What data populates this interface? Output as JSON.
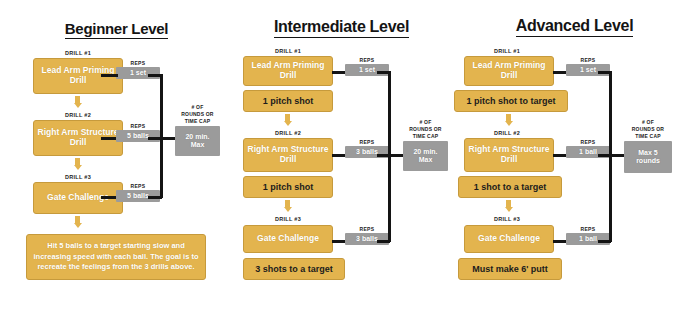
{
  "palette": {
    "gold": "#E3B44E",
    "gold_border": "#C69A3C",
    "gray": "#9B9B9B",
    "line": "#141414",
    "background": "#FFFFFF"
  },
  "columns": [
    {
      "id": "beginner",
      "title": "Beginner Level",
      "cap": {
        "label": "# OF\nROUNDS OR\nTIME CAP",
        "value": "20 min.\nMax"
      },
      "steps": [
        {
          "drill_caption": "DRILL #1",
          "box": "Lead Arm\nPriming Drill",
          "reps_label": "REPS",
          "reps_value": "1 set"
        },
        {
          "drill_caption": "DRILL #2",
          "box": "Right Arm\nStructure Drill",
          "reps_label": "REPS",
          "reps_value": "5 balls"
        },
        {
          "drill_caption": "DRILL #3",
          "box": "Gate Challenge",
          "reps_label": "REPS",
          "reps_value": "5 balls"
        }
      ],
      "summary": "Hit 5 balls to a target starting slow and increasing speed with each ball. The goal is to recreate the feelings from the 3 drills above."
    },
    {
      "id": "intermediate",
      "title": "Intermediate Level",
      "cap": {
        "label": "# OF\nROUNDS OR\nTIME CAP",
        "value": "20 min.\nMax"
      },
      "steps": [
        {
          "drill_caption": "DRILL #1",
          "box": "Lead Arm\nPriming Drill",
          "reps_label": "REPS",
          "reps_value": "1 set",
          "followup": "1 pitch shot"
        },
        {
          "drill_caption": "DRILL #2",
          "box": "Right Arm\nStructure Drill",
          "reps_label": "REPS",
          "reps_value": "3 balls",
          "followup": "1 pitch shot"
        },
        {
          "drill_caption": "DRILL #3",
          "box": "Gate Challenge",
          "reps_label": "REPS",
          "reps_value": "3 balls",
          "followup": "3 shots to a target"
        }
      ]
    },
    {
      "id": "advanced",
      "title": "Advanced Level",
      "cap": {
        "label": "# OF\nROUNDS OR\nTIME CAP",
        "value": "Max 5\nrounds"
      },
      "steps": [
        {
          "drill_caption": "DRILL #1",
          "box": "Lead Arm\nPriming Drill",
          "reps_label": "REPS",
          "reps_value": "1 set",
          "followup": "1 pitch shot to target"
        },
        {
          "drill_caption": "DRILL #2",
          "box": "Right Arm\nStructure Drill",
          "reps_label": "REPS",
          "reps_value": "1 ball",
          "followup": "1 shot to a target"
        },
        {
          "drill_caption": "DRILL #3",
          "box": "Gate Challenge",
          "reps_label": "REPS",
          "reps_value": "1 ball",
          "followup": "Must make 6' putt"
        }
      ]
    }
  ]
}
